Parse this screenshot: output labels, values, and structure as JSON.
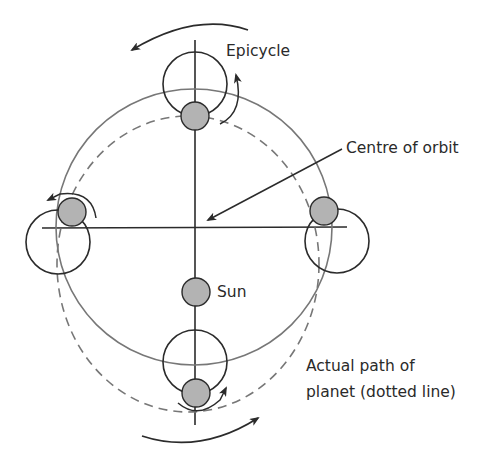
{
  "labels": {
    "epicycle": "Epicycle",
    "centre_of_orbit": "Centre of orbit",
    "sun": "Sun",
    "actual_path_line1": "Actual path of",
    "actual_path_line2": "planet (dotted line)"
  },
  "colors": {
    "line": "#2b2b2b",
    "orbit": "#777777",
    "planet_fill": "#b3b3b3",
    "background": "#ffffff"
  },
  "elements": {
    "deferent_orbit": "solid circle",
    "actual_path": "dashed circle",
    "epicycles": [
      "top",
      "left",
      "right",
      "bottom"
    ],
    "planets": [
      "top",
      "left",
      "right",
      "bottom"
    ],
    "sun": "grey disc on vertical axis below centre"
  }
}
